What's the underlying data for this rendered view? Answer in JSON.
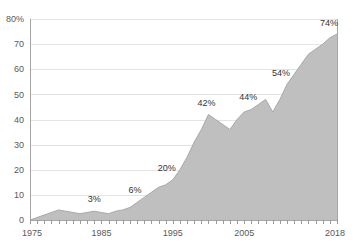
{
  "chart_data": {
    "type": "area",
    "title": "",
    "subtitle": "",
    "xlabel": "",
    "ylabel": "",
    "xlim": [
      1975,
      2018
    ],
    "ylim": [
      0,
      80
    ],
    "grid": true,
    "legend": "none",
    "series_name": "",
    "x": [
      1975,
      1976,
      1977,
      1978,
      1979,
      1980,
      1981,
      1982,
      1983,
      1984,
      1985,
      1986,
      1987,
      1988,
      1989,
      1990,
      1991,
      1992,
      1993,
      1994,
      1995,
      1996,
      1997,
      1998,
      1999,
      2000,
      2001,
      2002,
      2003,
      2004,
      2005,
      2006,
      2007,
      2008,
      2009,
      2010,
      2011,
      2012,
      2013,
      2014,
      2015,
      2016,
      2017,
      2018
    ],
    "values": [
      0,
      1,
      2,
      3,
      4,
      3.5,
      3,
      2.5,
      3,
      3.5,
      3,
      2.5,
      3.5,
      4,
      5,
      7,
      9,
      11,
      13,
      14,
      16,
      20,
      25,
      31,
      36,
      42,
      40,
      38,
      36,
      40,
      43,
      44,
      46,
      48,
      43,
      48,
      54,
      58,
      62,
      66,
      68,
      70,
      72.5,
      74
    ],
    "y_ticks": [
      0,
      10,
      20,
      30,
      40,
      50,
      60,
      70,
      80
    ],
    "y_tick_labels": [
      "0",
      "10",
      "20",
      "30",
      "40",
      "50",
      "60",
      "70",
      "80%"
    ],
    "x_ticks": [
      1975,
      1985,
      1995,
      2005,
      2018
    ],
    "x_tick_labels": [
      "1975",
      "1985",
      "1995",
      "2005",
      "2018"
    ],
    "annotations": [
      {
        "label": "3%",
        "x": 1984,
        "y": 3.5
      },
      {
        "label": "6%",
        "x": 1990,
        "y": 7
      },
      {
        "label": "20%",
        "x": 1995,
        "y": 16
      },
      {
        "label": "42%",
        "x": 2000,
        "y": 42
      },
      {
        "label": "44%",
        "x": 2006,
        "y": 44
      },
      {
        "label": "54%",
        "x": 2011,
        "y": 54
      },
      {
        "label": "74%",
        "x": 2018,
        "y": 74
      }
    ],
    "colors": {
      "area_fill": "#bfbfbf",
      "area_line": "#a8a8a8",
      "gridline": "#e3e3e3",
      "axis": "#a6a6a6",
      "tick_label": "#595959",
      "data_label": "#333333",
      "background": "#ffffff"
    }
  }
}
